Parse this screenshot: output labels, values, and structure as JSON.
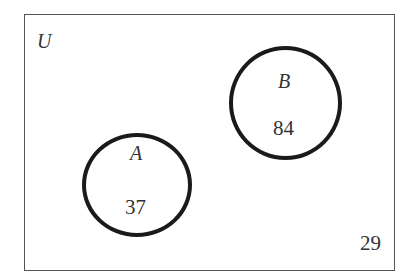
{
  "diagram": {
    "type": "venn",
    "universe": {
      "label": "U",
      "outside_count": "29"
    },
    "sets": [
      {
        "name": "A",
        "count": "37"
      },
      {
        "name": "B",
        "count": "84"
      }
    ],
    "intersection": "none (disjoint sets)",
    "colors": {
      "circle_stroke": "#1a1a1a",
      "box_stroke": "#555555",
      "text": "#333333",
      "background": "#ffffff"
    }
  }
}
